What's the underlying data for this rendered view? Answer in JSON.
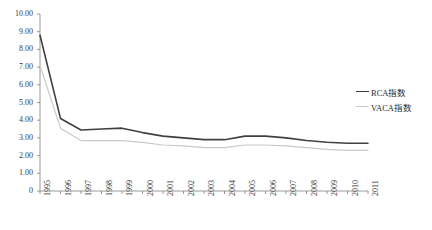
{
  "chart_data": {
    "type": "line",
    "title": "",
    "xlabel": "",
    "ylabel": "",
    "categories": [
      "1995",
      "1996",
      "1997",
      "1998",
      "1999",
      "2000",
      "2001",
      "2002",
      "2003",
      "2004",
      "2005",
      "2006",
      "2007",
      "2008",
      "2009",
      "2010",
      "2011"
    ],
    "x": [
      1995,
      1996,
      1997,
      1998,
      1999,
      2000,
      2001,
      2002,
      2003,
      2004,
      2005,
      2006,
      2007,
      2008,
      2009,
      2010,
      2011
    ],
    "ylim": [
      0,
      10
    ],
    "ytick_labels": [
      "10.00",
      "9.00",
      "8.00",
      "7.00",
      "6.00",
      "5.00",
      "4.00",
      "3.00",
      "2.00",
      "1.00",
      "0"
    ],
    "ytick_values": [
      10,
      9,
      8,
      7,
      6,
      5,
      4,
      3,
      2,
      1,
      0
    ],
    "grid": false,
    "legend_position": "right",
    "series": [
      {
        "name": "RCA指数",
        "color": "#404040",
        "values": [
          8.8,
          4.1,
          3.45,
          3.5,
          3.55,
          3.3,
          3.1,
          3.0,
          2.9,
          2.9,
          3.1,
          3.1,
          3.0,
          2.85,
          2.75,
          2.7,
          2.7
        ]
      },
      {
        "name": "VACA指数",
        "color": "#c9c9c9",
        "values": [
          7.1,
          3.55,
          2.85,
          2.85,
          2.85,
          2.75,
          2.6,
          2.55,
          2.45,
          2.45,
          2.6,
          2.6,
          2.55,
          2.45,
          2.35,
          2.3,
          2.3
        ]
      }
    ]
  },
  "axes": {
    "axis_color": "#808080",
    "tick_color": "#808080"
  }
}
